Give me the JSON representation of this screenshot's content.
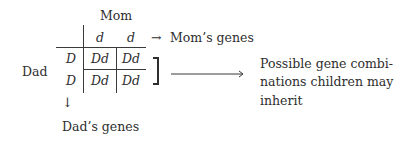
{
  "diagram": {
    "mom_label": "Mom",
    "dad_label": "Dad",
    "mom_alleles": [
      "d",
      "d"
    ],
    "dad_alleles": [
      "D",
      "D"
    ],
    "cells": [
      [
        "Dd",
        "Dd"
      ],
      [
        "Dd",
        "Dd"
      ]
    ],
    "mom_arrow": "→",
    "mom_genes_label": "Mom’s genes",
    "dad_arrow": "↓",
    "dad_genes_label": "Dad’s genes",
    "bracket": "]",
    "result_lines": [
      "Possible gene combi-",
      "nations children may",
      "inherit"
    ]
  }
}
